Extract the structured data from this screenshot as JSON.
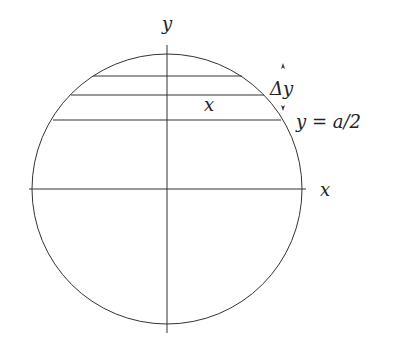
{
  "diagram": {
    "labels": {
      "y_axis": "y",
      "x_axis": "x",
      "strip_half_width": "x",
      "delta_y": "Δy",
      "boundary": "y = a/2"
    },
    "colors": {
      "stroke": "#333333",
      "background": "#ffffff"
    },
    "circle": {
      "cx": 167,
      "cy": 189,
      "r": 135
    },
    "horizontal_chords_y": [
      76,
      95,
      120
    ]
  }
}
